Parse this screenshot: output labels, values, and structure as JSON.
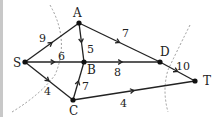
{
  "diagram": {
    "type": "directed-network",
    "nodes": [
      {
        "id": "S",
        "label": "S",
        "x": 25,
        "y": 62,
        "lx": 13,
        "ly": 67
      },
      {
        "id": "A",
        "label": "A",
        "x": 79,
        "y": 23,
        "lx": 73,
        "ly": 17
      },
      {
        "id": "B",
        "label": "B",
        "x": 84,
        "y": 62,
        "lx": 87,
        "ly": 74
      },
      {
        "id": "C",
        "label": "C",
        "x": 73,
        "y": 100,
        "lx": 69,
        "ly": 115
      },
      {
        "id": "D",
        "label": "D",
        "x": 160,
        "y": 62,
        "lx": 160,
        "ly": 56
      },
      {
        "id": "T",
        "label": "T",
        "x": 195,
        "y": 81,
        "lx": 203,
        "ly": 85
      }
    ],
    "edges": [
      {
        "from": "S",
        "to": "A",
        "weight": "9",
        "wx": 39,
        "wy": 42
      },
      {
        "from": "S",
        "to": "B",
        "weight": "6",
        "wx": 58,
        "wy": 60
      },
      {
        "from": "S",
        "to": "C",
        "weight": "4",
        "wx": 44,
        "wy": 95
      },
      {
        "from": "A",
        "to": "B",
        "weight": "5",
        "wx": 87,
        "wy": 53
      },
      {
        "from": "A",
        "to": "D",
        "weight": "7",
        "wx": 122,
        "wy": 37
      },
      {
        "from": "B",
        "to": "D",
        "weight": "8",
        "wx": 114,
        "wy": 76
      },
      {
        "from": "C",
        "to": "B",
        "weight": "7",
        "wx": 82,
        "wy": 90
      },
      {
        "from": "C",
        "to": "T",
        "weight": "4",
        "wx": 120,
        "wy": 107
      },
      {
        "from": "D",
        "to": "T",
        "weight": "10",
        "wx": 176,
        "wy": 70
      }
    ],
    "cuts": [
      {
        "name": "cut-1",
        "path": "M50 5 Q70 40 55 75 Q40 95 12 112"
      },
      {
        "name": "cut-2",
        "path": "M190 25 Q175 55 168 70 Q162 90 168 112"
      }
    ],
    "colors": {
      "edge": "#222222",
      "node": "#111111",
      "cut": "#999999",
      "border": "#c8c8c8"
    }
  }
}
